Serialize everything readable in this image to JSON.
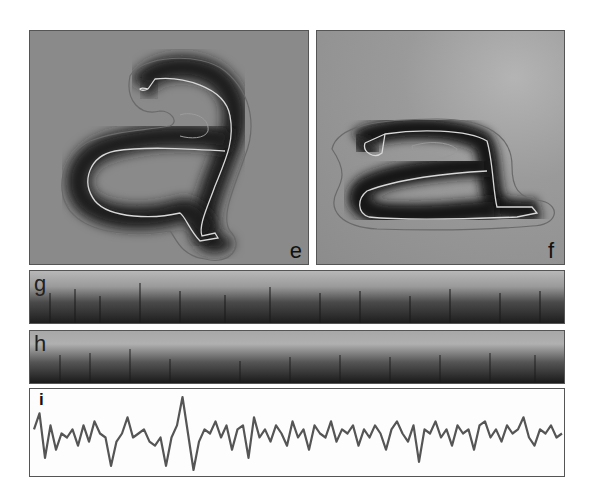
{
  "figure": {
    "panels": [
      {
        "id": "e",
        "label": "e",
        "type": "image",
        "description": "handwritten letter 'a' (upright) with contour outlines"
      },
      {
        "id": "f",
        "label": "f",
        "type": "image",
        "description": "letter 'a' (flattened/italic) with contour outlines"
      },
      {
        "id": "g",
        "label": "g",
        "type": "image-strip"
      },
      {
        "id": "h",
        "label": "h",
        "type": "image-strip"
      },
      {
        "id": "i",
        "label": "i",
        "type": "line-trace"
      }
    ]
  },
  "chart_data": {
    "type": "line",
    "title": "",
    "panel_label": "i",
    "xlabel": "",
    "ylabel": "",
    "grid": false,
    "legend": null,
    "series": [
      {
        "name": "signal",
        "color": "#555555",
        "values": [
          0.55,
          0.75,
          0.2,
          0.6,
          0.3,
          0.5,
          0.45,
          0.55,
          0.35,
          0.6,
          0.4,
          0.65,
          0.5,
          0.45,
          0.1,
          0.4,
          0.5,
          0.7,
          0.45,
          0.5,
          0.55,
          0.4,
          0.35,
          0.45,
          0.1,
          0.45,
          0.6,
          0.95,
          0.5,
          0.05,
          0.4,
          0.55,
          0.5,
          0.65,
          0.45,
          0.6,
          0.3,
          0.55,
          0.6,
          0.2,
          0.7,
          0.45,
          0.55,
          0.4,
          0.6,
          0.5,
          0.35,
          0.65,
          0.45,
          0.55,
          0.3,
          0.6,
          0.5,
          0.45,
          0.65,
          0.4,
          0.55,
          0.5,
          0.6,
          0.35,
          0.55,
          0.45,
          0.6,
          0.5,
          0.3,
          0.55,
          0.65,
          0.5,
          0.4,
          0.6,
          0.15,
          0.55,
          0.5,
          0.65,
          0.45,
          0.55,
          0.35,
          0.6,
          0.5,
          0.55,
          0.3,
          0.6,
          0.65,
          0.45,
          0.55,
          0.4,
          0.6,
          0.5,
          0.55,
          0.7,
          0.45,
          0.35,
          0.55,
          0.5,
          0.6,
          0.45,
          0.5
        ]
      }
    ]
  }
}
